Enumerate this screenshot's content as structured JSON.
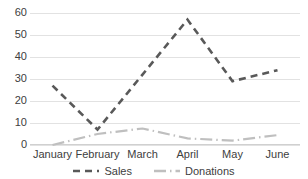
{
  "chart_data": {
    "type": "line",
    "title": "",
    "xlabel": "",
    "ylabel": "",
    "categories": [
      "January",
      "February",
      "March",
      "April",
      "May",
      "June"
    ],
    "series": [
      {
        "name": "Sales",
        "values": [
          27,
          7,
          32,
          57,
          29,
          34
        ],
        "color": "#595959",
        "dash": "dashed"
      },
      {
        "name": "Donations",
        "values": [
          0,
          5,
          7.5,
          3,
          2,
          4.5
        ],
        "color": "#bfbfbf",
        "dash": "dash-dot"
      }
    ],
    "ylim": [
      0,
      60
    ],
    "yticks": [
      0,
      10,
      20,
      30,
      40,
      50,
      60
    ],
    "ytick_labels": [
      "0",
      "10",
      "20",
      "30",
      "40",
      "50",
      "60"
    ],
    "grid": "horizontal",
    "legend_position": "bottom"
  },
  "legend": {
    "items": [
      {
        "label": "Sales"
      },
      {
        "label": "Donations"
      }
    ]
  },
  "colors": {
    "sales": "#595959",
    "donations": "#bfbfbf",
    "gridline": "#e2e2e2",
    "text": "#404040",
    "background": "#ffffff"
  }
}
